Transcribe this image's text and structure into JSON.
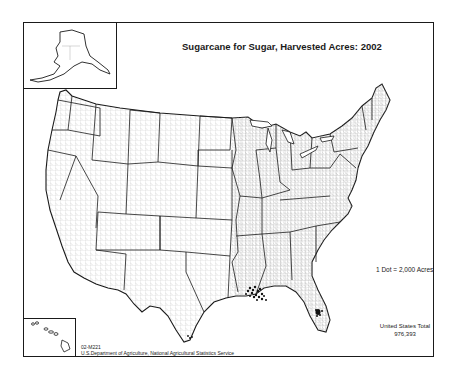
{
  "map": {
    "title": "Sugarcane for Sugar, Harvested Acres:  2002",
    "legend": {
      "dot_label": "1 Dot = 2,000 Acres"
    },
    "total": {
      "label": "United States Total",
      "value": "976,393"
    },
    "credit": {
      "code": "02-M221",
      "agency": "U.S.Department of Agriculture, National Agricultural Statistics Service"
    },
    "insets": [
      "Alaska",
      "Hawaii"
    ],
    "colors": {
      "border": "#1a1a1a",
      "county_lines": "#9a9a9a",
      "dots": "#111111",
      "background": "#ffffff"
    }
  }
}
